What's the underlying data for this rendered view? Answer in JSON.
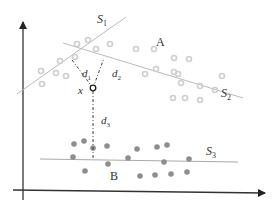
{
  "diagram": {
    "labels": {
      "s1": "S",
      "s1_sub": "1",
      "s2": "S",
      "s2_sub": "2",
      "s3": "S",
      "s3_sub": "3",
      "cluster_a": "A",
      "cluster_b": "B",
      "point_x": "x",
      "d1": "d",
      "d1_sub": "1",
      "d2": "d",
      "d2_sub": "2",
      "d3": "d",
      "d3_sub": "3"
    },
    "colors": {
      "axis": "#222222",
      "line": "#b8b8b8",
      "cluster_a_point": "#cfcfcf",
      "cluster_b_point": "#8a8a8a",
      "dash": "#444444"
    },
    "cluster_a_points": [
      [
        77,
        43
      ],
      [
        88,
        40
      ],
      [
        110,
        44
      ],
      [
        134,
        50
      ],
      [
        60,
        61
      ],
      [
        75,
        57
      ],
      [
        96,
        49
      ],
      [
        42,
        71
      ],
      [
        56,
        73
      ],
      [
        42,
        84
      ],
      [
        66,
        76
      ],
      [
        155,
        49
      ],
      [
        176,
        58
      ],
      [
        189,
        58
      ],
      [
        156,
        70
      ],
      [
        173,
        71
      ],
      [
        147,
        78
      ],
      [
        178,
        74
      ],
      [
        182,
        83
      ],
      [
        200,
        86
      ],
      [
        172,
        97
      ],
      [
        185,
        98
      ],
      [
        199,
        101
      ]
    ],
    "cluster_b_points": [
      [
        74,
        144
      ],
      [
        84,
        141
      ],
      [
        93,
        148
      ],
      [
        107,
        146
      ],
      [
        73,
        157
      ],
      [
        85,
        170
      ],
      [
        108,
        164
      ],
      [
        128,
        158
      ],
      [
        137,
        149
      ],
      [
        158,
        147
      ],
      [
        167,
        145
      ],
      [
        165,
        161
      ],
      [
        190,
        158
      ],
      [
        158,
        174
      ],
      [
        175,
        174
      ],
      [
        188,
        171
      ],
      [
        138,
        177
      ]
    ],
    "point_x_pos": [
      93,
      88
    ]
  }
}
